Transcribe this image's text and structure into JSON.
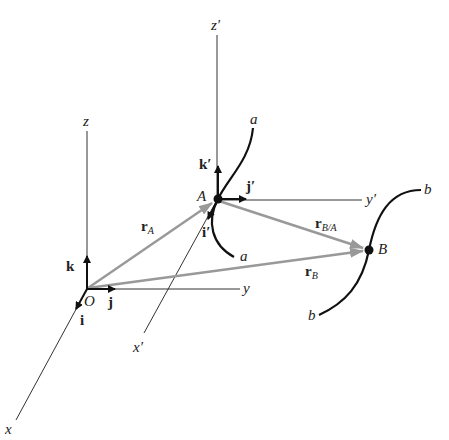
{
  "diagram": {
    "colors": {
      "axis": "#333333",
      "unit_vector": "#111111",
      "position_vector": "#999999",
      "path": "#111111",
      "background": "#ffffff"
    },
    "fixed_frame": {
      "origin": "O",
      "axes": {
        "x": "x",
        "y": "y",
        "z": "z"
      },
      "unit_vectors": {
        "i": "i",
        "j": "j",
        "k": "k"
      }
    },
    "moving_frame": {
      "origin": "A",
      "axes": {
        "x": "x′",
        "y": "y′",
        "z": "z′"
      },
      "unit_vectors": {
        "i": "i′",
        "j": "j′",
        "k": "k′"
      }
    },
    "points": {
      "A": "A",
      "B": "B"
    },
    "paths": {
      "a_top": "a",
      "a_bottom": "a",
      "b_top": "b",
      "b_bottom": "b"
    },
    "vectors": {
      "rA": {
        "main": "r",
        "sub": "A"
      },
      "rB": {
        "main": "r",
        "sub": "B"
      },
      "rBA": {
        "main": "r",
        "sub": "B/A"
      }
    }
  }
}
